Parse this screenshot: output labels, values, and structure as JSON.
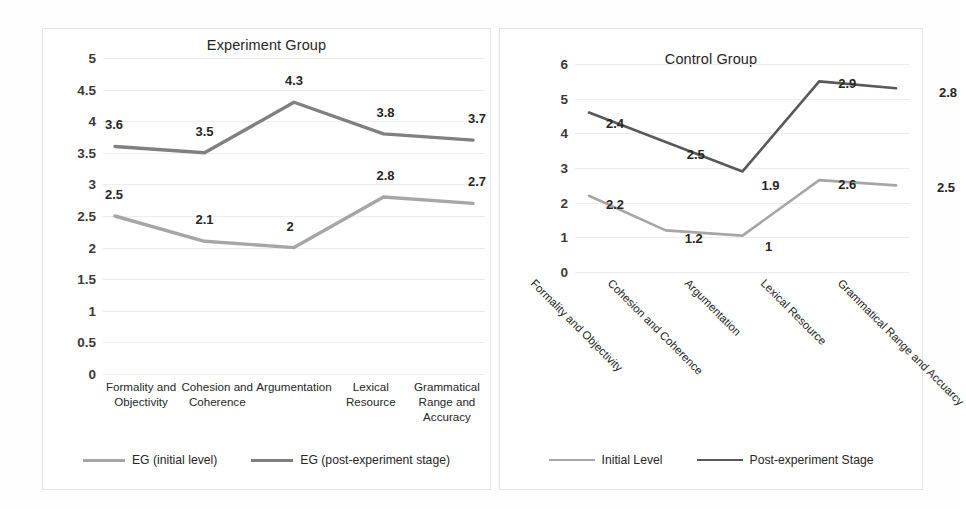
{
  "chart_data": [
    {
      "type": "line",
      "title": "Experiment Group",
      "xlabel": "",
      "ylabel": "",
      "ylim": [
        0,
        5
      ],
      "yticks": [
        "0",
        "0.5",
        "1",
        "1.5",
        "2",
        "2.5",
        "3",
        "3.5",
        "4",
        "4.5",
        "5"
      ],
      "grid": true,
      "legend_position": "bottom",
      "categories": [
        "Formality and Objectivity",
        "Cohesion and Coherence",
        "Argumentation",
        "Lexical Resource",
        "Grammatical Range and Accuracy"
      ],
      "series": [
        {
          "name": "EG (initial level)",
          "color": "#a6a6a6",
          "values": [
            2.5,
            2.1,
            2,
            2.8,
            2.7
          ],
          "labels": [
            "2.5",
            "2.1",
            "2",
            "2.8",
            "2.7"
          ]
        },
        {
          "name": "EG (post-experiment stage)",
          "color": "#808080",
          "values": [
            3.6,
            3.5,
            4.3,
            3.8,
            3.7
          ],
          "labels": [
            "3.6",
            "3.5",
            "4.3",
            "3.8",
            "3.7"
          ]
        }
      ]
    },
    {
      "type": "line",
      "title": "Control Group",
      "xlabel": "",
      "ylabel": "",
      "ylim": [
        0,
        6
      ],
      "yticks": [
        "0",
        "1",
        "2",
        "3",
        "4",
        "5",
        "6"
      ],
      "grid": true,
      "legend_position": "bottom",
      "categories": [
        "Formality and Objectivity",
        "Cohesion and Coherence",
        "Argumentation",
        "Lexical Resource",
        "Grammatical Range and Accuarcy"
      ],
      "series": [
        {
          "name": "Initial Level",
          "color": "#a6a6a6",
          "values": [
            2.2,
            1.2,
            1.05,
            2.65,
            2.5
          ],
          "labels": [
            "2.2",
            "1.2",
            "1",
            "2.6",
            "2.5"
          ]
        },
        {
          "name": "Post-experiment Stage",
          "color": "#595959",
          "values": [
            4.6,
            3.75,
            2.9,
            5.5,
            5.3
          ],
          "labels": [
            "2.4",
            "2.5",
            "1.9",
            "2.9",
            "2.8"
          ]
        }
      ]
    }
  ],
  "left_chart": {
    "title": "Experiment Group",
    "yticks": [
      "5",
      "4.5",
      "4",
      "3.5",
      "3",
      "2.5",
      "2",
      "1.5",
      "1",
      "0.5",
      "0"
    ],
    "categories": [
      "Formality and Objectivity",
      "Cohesion and Coherence",
      "Argumentation",
      "Lexical Resource",
      "Grammatical Range and Accuracy"
    ],
    "labels_initial": [
      "2.5",
      "2.1",
      "2",
      "2.8",
      "2.7"
    ],
    "labels_post": [
      "3.6",
      "3.5",
      "4.3",
      "3.8",
      "3.7"
    ],
    "legend": [
      {
        "label": "EG (initial level)",
        "color": "#a6a6a6"
      },
      {
        "label": "EG (post-experiment stage)",
        "color": "#808080"
      }
    ]
  },
  "right_chart": {
    "title": "Control Group",
    "yticks": [
      "6",
      "5",
      "4",
      "3",
      "2",
      "1",
      "0"
    ],
    "categories": [
      "Formality and Objectivity",
      "Cohesion and Coherence",
      "Argumentation",
      "Lexical Resource",
      "Grammatical Range and Accuarcy"
    ],
    "labels_initial": [
      "2.2",
      "1.2",
      "1",
      "2.6",
      "2.5"
    ],
    "labels_post": [
      "2.4",
      "2.5",
      "1.9",
      "2.9",
      "2.8"
    ],
    "legend": [
      {
        "label": "Initial Level",
        "color": "#a6a6a6"
      },
      {
        "label": "Post-experiment Stage",
        "color": "#595959"
      }
    ]
  }
}
